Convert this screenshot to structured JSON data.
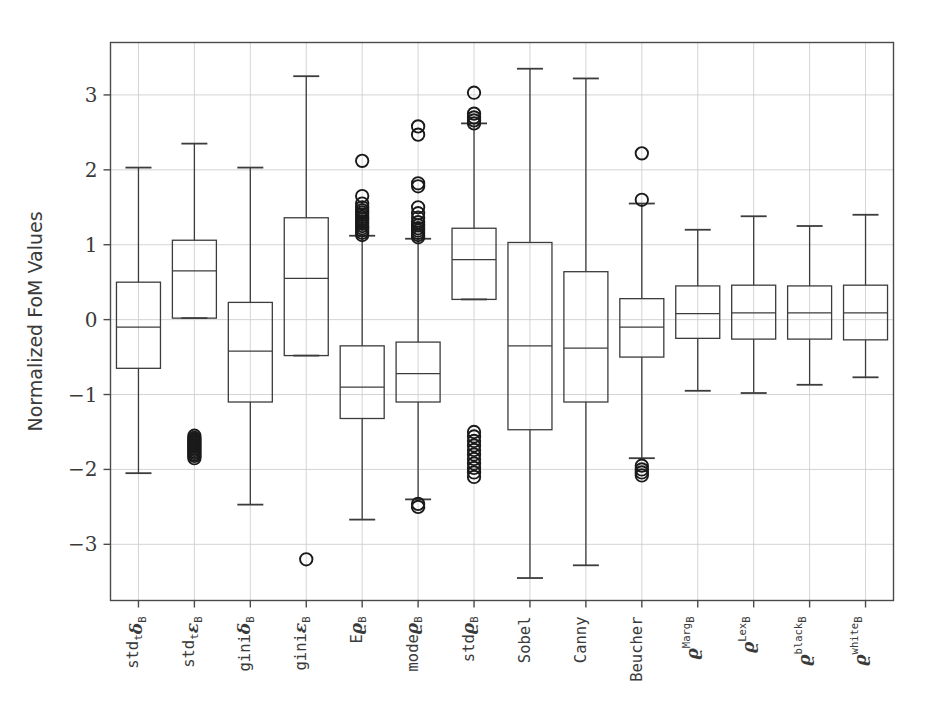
{
  "chart_data": {
    "type": "box",
    "title": "",
    "xlabel": "",
    "ylabel": "Normalized FoM Values",
    "ylim": [
      -3.75,
      3.7
    ],
    "yticks": [
      -3,
      -2,
      -1,
      0,
      1,
      2,
      3
    ],
    "ytick_labels": [
      "-3",
      "-2",
      "-1",
      "0",
      "1",
      "2",
      "3"
    ],
    "grid": true,
    "legend": "none",
    "categories": [
      "std_t δ_B",
      "std_t ε_B",
      "gini δ_B",
      "gini ε_B",
      "E ρ_B",
      "mode ρ_B",
      "std ρ_B",
      "Sobel",
      "Canny",
      "Beucher",
      "ρ_B^Marg",
      "ρ_B^Lex",
      "ρ_B^black",
      "ρ_B^white"
    ],
    "category_labels": [
      {
        "base": "std",
        "sub": "t",
        "greek": "δ",
        "greeksub": "B",
        "sup": "",
        "mono": true
      },
      {
        "base": "std",
        "sub": "t",
        "greek": "ε",
        "greeksub": "B",
        "sup": "",
        "mono": true
      },
      {
        "base": "gini",
        "sub": "",
        "greek": "δ",
        "greeksub": "B",
        "sup": "",
        "mono": true
      },
      {
        "base": "gini",
        "sub": "",
        "greek": "ε",
        "greeksub": "B",
        "sup": "",
        "mono": true
      },
      {
        "base": "E",
        "sub": "",
        "greek": "ϱ",
        "greeksub": "B",
        "sup": "",
        "mono": false
      },
      {
        "base": "mode",
        "sub": "",
        "greek": "ϱ",
        "greeksub": "B",
        "sup": "",
        "mono": true
      },
      {
        "base": "std",
        "sub": "",
        "greek": "ϱ",
        "greeksub": "B",
        "sup": "",
        "mono": true
      },
      {
        "base": "Sobel",
        "sub": "",
        "greek": "",
        "greeksub": "",
        "sup": "",
        "mono": false
      },
      {
        "base": "Canny",
        "sub": "",
        "greek": "",
        "greeksub": "",
        "sup": "",
        "mono": false
      },
      {
        "base": "Beucher",
        "sub": "",
        "greek": "",
        "greeksub": "",
        "sup": "",
        "mono": false
      },
      {
        "base": "",
        "sub": "",
        "greek": "ϱ",
        "greeksub": "B",
        "sup": "Marg",
        "mono": false
      },
      {
        "base": "",
        "sub": "",
        "greek": "ϱ",
        "greeksub": "B",
        "sup": "Lex",
        "mono": false
      },
      {
        "base": "",
        "sub": "",
        "greek": "ϱ",
        "greeksub": "B",
        "sup": "black",
        "mono": false
      },
      {
        "base": "",
        "sub": "",
        "greek": "ϱ",
        "greeksub": "B",
        "sup": "white",
        "mono": false
      }
    ],
    "boxes": [
      {
        "name": "std_t delta_B",
        "whisker_low": -2.05,
        "q1": -0.65,
        "median": -0.1,
        "q3": 0.5,
        "whisker_high": 2.03,
        "outliers": []
      },
      {
        "name": "std_t epsilon_B",
        "whisker_low": 0.02,
        "q1": 0.02,
        "median": 0.65,
        "q3": 1.06,
        "whisker_high": 2.35,
        "outliers": [
          -1.55,
          -1.58,
          -1.6,
          -1.62,
          -1.64,
          -1.66,
          -1.68,
          -1.7,
          -1.72,
          -1.74,
          -1.76,
          -1.78,
          -1.8,
          -1.82,
          -1.85
        ]
      },
      {
        "name": "gini delta_B",
        "whisker_low": -2.47,
        "q1": -1.1,
        "median": -0.42,
        "q3": 0.23,
        "whisker_high": 2.03,
        "outliers": []
      },
      {
        "name": "gini epsilon_B",
        "whisker_low": -0.48,
        "q1": -0.48,
        "median": 0.55,
        "q3": 1.36,
        "whisker_high": 3.25,
        "outliers": [
          -3.2
        ]
      },
      {
        "name": "E rho_B",
        "whisker_low": -2.67,
        "q1": -1.32,
        "median": -0.9,
        "q3": -0.35,
        "whisker_high": 1.12,
        "outliers": [
          2.12,
          1.65,
          1.55,
          1.5,
          1.46,
          1.43,
          1.4,
          1.37,
          1.34,
          1.31,
          1.28,
          1.25,
          1.22,
          1.19,
          1.16,
          1.13
        ]
      },
      {
        "name": "mode rho_B",
        "whisker_low": -2.4,
        "q1": -1.1,
        "median": -0.72,
        "q3": -0.3,
        "whisker_high": 1.08,
        "outliers": [
          2.58,
          2.47,
          1.82,
          1.78,
          1.5,
          1.42,
          1.36,
          1.3,
          1.26,
          1.22,
          1.19,
          1.16,
          1.13,
          1.1,
          -2.5,
          -2.46
        ]
      },
      {
        "name": "std rho_B",
        "whisker_low": 0.27,
        "q1": 0.27,
        "median": 0.8,
        "q3": 1.22,
        "whisker_high": 2.62,
        "outliers": [
          3.03,
          2.75,
          2.7,
          2.66,
          2.62,
          -1.5,
          -1.56,
          -1.62,
          -1.68,
          -1.74,
          -1.8,
          -1.86,
          -1.92,
          -1.98,
          -2.04,
          -2.1
        ]
      },
      {
        "name": "Sobel",
        "whisker_low": -3.45,
        "q1": -1.47,
        "median": -0.35,
        "q3": 1.03,
        "whisker_high": 3.35,
        "outliers": []
      },
      {
        "name": "Canny",
        "whisker_low": -3.28,
        "q1": -1.1,
        "median": -0.38,
        "q3": 0.64,
        "whisker_high": 3.22,
        "outliers": []
      },
      {
        "name": "Beucher",
        "whisker_low": -1.85,
        "q1": -0.5,
        "median": -0.1,
        "q3": 0.28,
        "whisker_high": 1.55,
        "outliers": [
          2.22,
          1.6,
          -1.95,
          -2.0,
          -2.04,
          -2.08
        ]
      },
      {
        "name": "rho_B Marg",
        "whisker_low": -0.95,
        "q1": -0.25,
        "median": 0.08,
        "q3": 0.45,
        "whisker_high": 1.2,
        "outliers": []
      },
      {
        "name": "rho_B Lex",
        "whisker_low": -0.98,
        "q1": -0.26,
        "median": 0.09,
        "q3": 0.46,
        "whisker_high": 1.38,
        "outliers": []
      },
      {
        "name": "rho_B black",
        "whisker_low": -0.87,
        "q1": -0.26,
        "median": 0.09,
        "q3": 0.45,
        "whisker_high": 1.25,
        "outliers": []
      },
      {
        "name": "rho_B white",
        "whisker_low": -0.77,
        "q1": -0.27,
        "median": 0.09,
        "q3": 0.46,
        "whisker_high": 1.4,
        "outliers": []
      }
    ],
    "colors": {
      "background": "#ffffff",
      "axis": "#4a4a4a",
      "grid": "#cfcfcf",
      "box_line": "#3c3c3c",
      "outlier_line": "#1a1a1a"
    }
  }
}
